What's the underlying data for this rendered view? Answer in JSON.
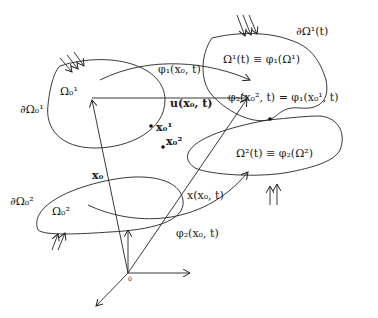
{
  "diagram": {
    "type": "two-body contact kinematics",
    "labels": {
      "omega1_ref": "Ω₀¹",
      "boundary1_ref": "∂Ω₀¹",
      "omega2_ref": "Ω₀²",
      "boundary2_ref": "∂Ω₀²",
      "phi1_map": "φ₁(x₀, t)",
      "phi2_map": "φ₂(x₀, t)",
      "displacement": "u(x₀, t)",
      "position_current": "x(x₀, t)",
      "position_ref": "x₀",
      "point1": "x₀¹",
      "point2": "x₀²",
      "omega1_current": "Ω¹(t) ≡ φ₁(Ω¹)",
      "boundary1_current": "∂Ω¹(t)",
      "omega2_current": "Ω²(t) ≡ φ₂(Ω²)",
      "contact_condition": "φ₂(x₀², t) = φ₁(x₀¹, t)",
      "origin": "0"
    }
  }
}
